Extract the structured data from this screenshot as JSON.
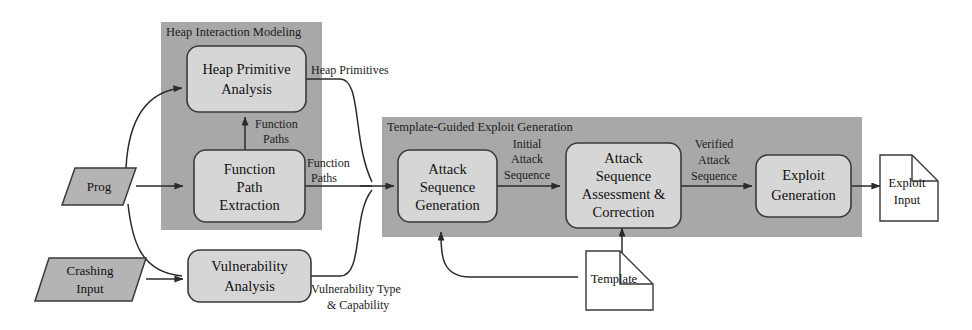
{
  "figure": {
    "type": "flow-diagram",
    "colors": {
      "group_fill": "#a8a8a8",
      "node_fill": "#d6d6d6",
      "io_fill": "#b4b4b4",
      "doc_fill": "#ffffff",
      "stroke": "#333333",
      "background": "#ffffff"
    }
  },
  "groups": [
    {
      "id": "heap_interaction",
      "label": "Heap Interaction Modeling"
    },
    {
      "id": "template_guided",
      "label": "Template-Guided Exploit Generation"
    }
  ],
  "io_nodes": [
    {
      "id": "prog",
      "label": "Prog",
      "shape": "parallelogram"
    },
    {
      "id": "crashing_input",
      "label_line1": "Crashing",
      "label_line2": "Input",
      "shape": "parallelogram"
    }
  ],
  "doc_nodes": [
    {
      "id": "template",
      "label": "Template",
      "shape": "document"
    },
    {
      "id": "exploit_input",
      "label_line1": "Exploit",
      "label_line2": "Input",
      "shape": "document"
    }
  ],
  "process_nodes": [
    {
      "id": "heap_primitive_analysis",
      "line1": "Heap Primitive",
      "line2": "Analysis",
      "group": "heap_interaction"
    },
    {
      "id": "function_path_extraction",
      "line1": "Function",
      "line2": "Path",
      "line3": "Extraction",
      "group": "heap_interaction"
    },
    {
      "id": "vulnerability_analysis",
      "line1": "Vulnerability",
      "line2": "Analysis",
      "group": null
    },
    {
      "id": "attack_sequence_generation",
      "line1": "Attack",
      "line2": "Sequence",
      "line3": "Generation",
      "group": "template_guided"
    },
    {
      "id": "attack_sequence_assessment",
      "line1": "Attack",
      "line2": "Sequence",
      "line3": "Assessment &",
      "line4": "Correction",
      "group": "template_guided"
    },
    {
      "id": "exploit_generation",
      "line1": "Exploit",
      "line2": "Generation",
      "group": "template_guided"
    }
  ],
  "edge_labels": [
    {
      "id": "heap_primitives",
      "line1": "Heap Primitives"
    },
    {
      "id": "function_paths_up",
      "line1": "Function",
      "line2": "Paths"
    },
    {
      "id": "function_paths_right",
      "line1": "Function",
      "line2": "Paths"
    },
    {
      "id": "vulnerability_type",
      "line1": "Vulnerability Type",
      "line2": "& Capability"
    },
    {
      "id": "initial_attack_sequence",
      "line1": "Initial",
      "line2": "Attack",
      "line3": "Sequence"
    },
    {
      "id": "verified_attack_sequence",
      "line1": "Verified",
      "line2": "Attack",
      "line3": "Sequence"
    }
  ]
}
